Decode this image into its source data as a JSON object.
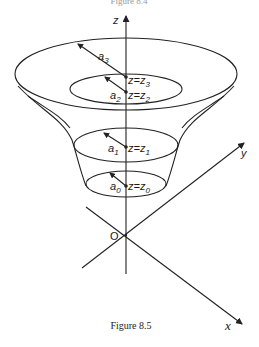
{
  "figure": {
    "top_caption_partial": "Figure 8.4",
    "caption": "Figure 8.5",
    "axes": {
      "z_label": "z",
      "y_label": "y",
      "x_label": "x",
      "origin_label": "O"
    },
    "levels": [
      {
        "radius_label": "a",
        "radius_sub": "3",
        "z_label": "z=z",
        "z_sub": "3"
      },
      {
        "radius_label": "a",
        "radius_sub": "2",
        "z_label": "z=z",
        "z_sub": "2"
      },
      {
        "radius_label": "a",
        "radius_sub": "1",
        "z_label": "z=z",
        "z_sub": "1"
      },
      {
        "radius_label": "a",
        "radius_sub": "0",
        "z_label": "z=z",
        "z_sub": "0"
      }
    ],
    "colors": {
      "ink": "#222222",
      "background": "#ffffff"
    }
  }
}
